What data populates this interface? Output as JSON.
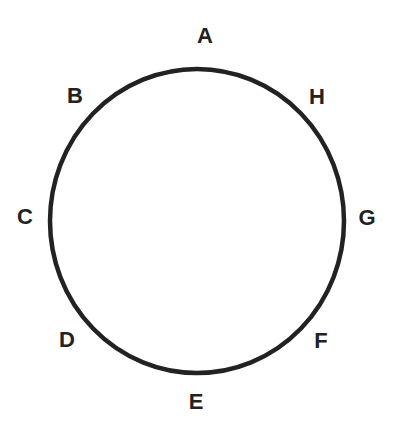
{
  "diagram": {
    "shape": "circle",
    "stroke_color": "#222222",
    "labels": [
      {
        "text": "A",
        "x": 205,
        "y": 36
      },
      {
        "text": "B",
        "x": 75,
        "y": 96
      },
      {
        "text": "C",
        "x": 25,
        "y": 217
      },
      {
        "text": "D",
        "x": 67,
        "y": 340
      },
      {
        "text": "E",
        "x": 196,
        "y": 402
      },
      {
        "text": "F",
        "x": 321,
        "y": 341
      },
      {
        "text": "G",
        "x": 367,
        "y": 218
      },
      {
        "text": "H",
        "x": 317,
        "y": 97
      }
    ]
  }
}
